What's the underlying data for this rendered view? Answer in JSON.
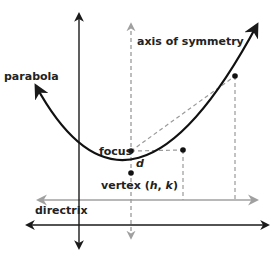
{
  "diagram": {
    "labels": {
      "parabola": "parabola",
      "axis_of_symmetry": "axis of symmetry",
      "focus": "focus",
      "d": "d",
      "vertex_prefix": "vertex (",
      "vertex_h": "h",
      "vertex_sep": ", ",
      "vertex_k": "k",
      "vertex_suffix": ")",
      "directrix": "directrix"
    },
    "colors": {
      "axes": "#1a1a1a",
      "parabola": "#111111",
      "guides": "#9a9a9a",
      "directrix": "#a0a0a0",
      "text": "#222222"
    },
    "points": {
      "vertex": [
        131,
        173
      ],
      "focus": [
        131,
        151
      ],
      "point_a": [
        183,
        150
      ],
      "point_b": [
        235,
        76
      ]
    }
  }
}
